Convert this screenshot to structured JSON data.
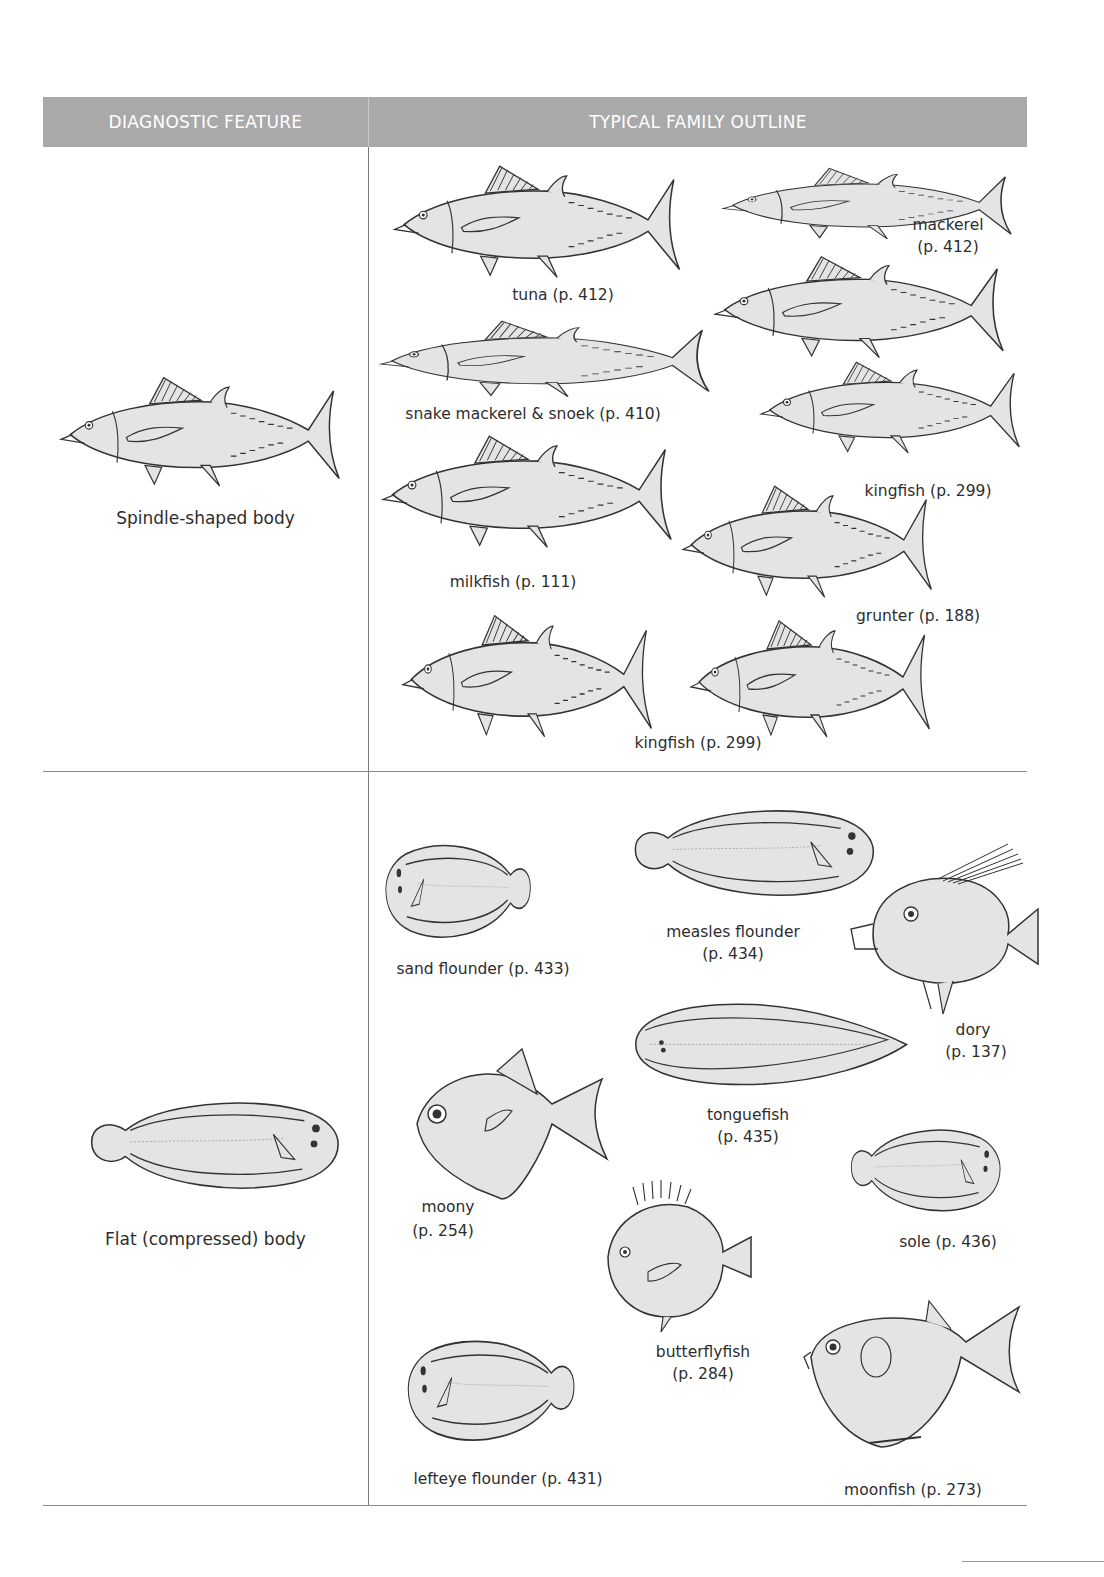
{
  "table": {
    "headers": {
      "left": "DIAGNOSTIC FEATURE",
      "right": "TYPICAL FAMILY OUTLINE"
    },
    "colors": {
      "header_bg": "#a9a9a9",
      "header_text": "#ffffff",
      "fish_fill": "#e4e4e4",
      "fish_stroke": "#333333",
      "rule": "#8a8a8a"
    },
    "rows": [
      {
        "feature": "Spindle-shaped body",
        "families": [
          {
            "name": "tuna",
            "page": "(p. 412)",
            "label": "tuna (p. 412)"
          },
          {
            "name": "mackerel",
            "label_line1": "mackerel",
            "label_line2": "(p. 412)"
          },
          {
            "name": "snake mackerel & snoek",
            "label": "snake mackerel & snoek (p. 410)"
          },
          {
            "name": "kingfish",
            "label": "kingfish (p. 299)"
          },
          {
            "name": "milkfish",
            "label": "milkfish (p. 111)"
          },
          {
            "name": "grunter",
            "label": "grunter (p. 188)"
          },
          {
            "name": "kingfish",
            "label": "kingfish (p. 299)"
          }
        ]
      },
      {
        "feature": "Flat (compressed) body",
        "families": [
          {
            "name": "sand flounder",
            "label": "sand flounder (p. 433)"
          },
          {
            "name": "measles flounder",
            "label_line1": "measles flounder",
            "label_line2": "(p. 434)"
          },
          {
            "name": "dory",
            "label_line1": "dory",
            "label_line2": "(p. 137)"
          },
          {
            "name": "tonguefish",
            "label_line1": "tonguefish",
            "label_line2": "(p. 435)"
          },
          {
            "name": "moony",
            "label_line1": "moony",
            "label_line2": "(p. 254)"
          },
          {
            "name": "sole",
            "label": "sole (p. 436)"
          },
          {
            "name": "butterflyfish",
            "label_line1": "butterflyfish",
            "label_line2": "(p. 284)"
          },
          {
            "name": "lefteye flounder",
            "label": "lefteye flounder (p. 431)"
          },
          {
            "name": "moonfish",
            "label": "moonfish (p. 273)"
          }
        ]
      }
    ]
  }
}
